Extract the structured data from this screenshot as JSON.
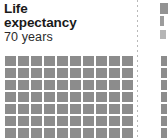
{
  "panel": {
    "background_color": "#ffffff",
    "divider_color": "#b9b9b9",
    "divider_style": "dotted-vertical"
  },
  "card": {
    "title": "Life expectancy",
    "subtitle": "70 years",
    "title_color": "#1a1a1a",
    "subtitle_color": "#2b2b2b"
  },
  "chart_data": {
    "type": "pictogram",
    "title": "Life expectancy",
    "subtitle": "70 years",
    "unit_label": "years",
    "value": 70,
    "total_units": 70,
    "filled_units": 70,
    "columns": 10,
    "rows": 7,
    "unit_shape": "square",
    "unit_color": "#8c8c8c",
    "legend": [],
    "xlabel": "",
    "ylabel": "",
    "grid": false
  },
  "next_card": {
    "visible_fragment": true,
    "description": "cut-off adjacent pictogram card"
  }
}
